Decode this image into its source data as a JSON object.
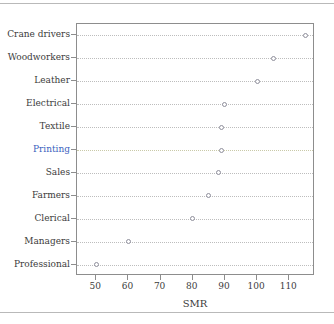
{
  "chart_data": {
    "type": "scatter",
    "title": "",
    "subtitle": "",
    "xlabel": "SMR",
    "ylabel": "",
    "xlim": [
      44,
      118
    ],
    "ylim": [
      0,
      12
    ],
    "grid": true,
    "grid_axis": "y",
    "legend": null,
    "orientation": "horizontal-dotplot",
    "xticks": [
      50,
      60,
      70,
      80,
      90,
      100,
      110
    ],
    "xticklabels": [
      "50",
      "60",
      "70",
      "80",
      "90",
      "100",
      "110"
    ],
    "categories": [
      "Crane drivers",
      "Woodworkers",
      "Leather",
      "Electrical",
      "Textile",
      "Printing",
      "Sales",
      "Farmers",
      "Clerical",
      "Managers",
      "Professional"
    ],
    "values": [
      115,
      105,
      100,
      90,
      89,
      89,
      88,
      85,
      80,
      60,
      50
    ],
    "points": [
      {
        "category": "Crane drivers",
        "value": 115,
        "highlight": false
      },
      {
        "category": "Woodworkers",
        "value": 105,
        "highlight": false
      },
      {
        "category": "Leather",
        "value": 100,
        "highlight": false
      },
      {
        "category": "Electrical",
        "value": 90,
        "highlight": false
      },
      {
        "category": "Textile",
        "value": 89,
        "highlight": false
      },
      {
        "category": "Printing",
        "value": 89,
        "highlight": true
      },
      {
        "category": "Sales",
        "value": 88,
        "highlight": false
      },
      {
        "category": "Farmers",
        "value": 85,
        "highlight": false
      },
      {
        "category": "Clerical",
        "value": 80,
        "highlight": false
      },
      {
        "category": "Managers",
        "value": 60,
        "highlight": false
      },
      {
        "category": "Professional",
        "value": 50,
        "highlight": false
      }
    ],
    "highlighted_category": "Printing",
    "colors": {
      "marker_edge": "#8f8f9c",
      "marker_fill": "#ffffff",
      "gridline": "#bdbdbd",
      "highlight_gridline": "#c9c9a8",
      "axis": "#8d8d8d",
      "text": "#3b3b3b",
      "highlight_text": "#3b5fbe",
      "background": "#ffffff"
    }
  }
}
